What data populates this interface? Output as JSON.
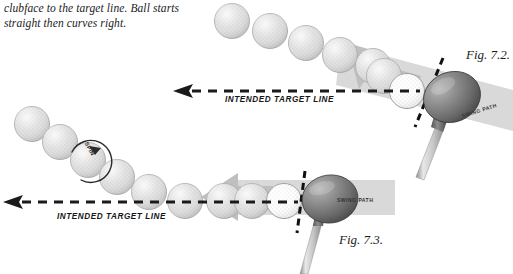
{
  "caption": {
    "text": "clubface to the target line. Ball starts straight then curves right."
  },
  "figures": [
    {
      "id": "fig-7-2",
      "label": "Fig. 7.2.",
      "target_line_label": "INTENDED TARGET LINE",
      "swing_path_label": "SWING PATH",
      "description": "Golf driver at impact with swing path angled out-to-in, ball trajectory curving left and upward",
      "ball_count": 7,
      "impact_ball_color": "#ffffff",
      "flight_ball_color": "#dadada",
      "swing_path_band_color": "#d8d8d8",
      "swing_path_arrow_color": "#bdbdbd",
      "club_head_color": "#6e6e6e",
      "club_shaft_color": "#c9c9c9",
      "target_line_color": "#1a1a1a",
      "clubface_line_color": "#111111"
    },
    {
      "id": "fig-7-3",
      "label": "Fig. 7.3.",
      "target_line_label": "INTENDED TARGET LINE",
      "swing_path_label": "SWING PATH",
      "spin_label": "SPIN",
      "description": "Golf driver at impact with level swing path, ball starts straight then curves with sidespin",
      "ball_count": 8,
      "impact_ball_color": "#ffffff",
      "flight_ball_color": "#dadada",
      "swing_path_band_color": "#d8d8d8",
      "swing_path_arrow_color": "#bdbdbd",
      "club_head_color": "#6e6e6e",
      "club_shaft_color": "#c9c9c9",
      "target_line_color": "#1a1a1a",
      "clubface_line_color": "#111111"
    }
  ],
  "colors": {
    "background": "#ffffff",
    "text": "#1b1b1b",
    "ball_fill": "#dcdcdc",
    "ball_stroke": "#a8a8a8",
    "band": "#d8d8d8",
    "arrow": "#bcbcbc",
    "clubhead_dark": "#4f4f4f",
    "clubhead_light": "#9a9a9a",
    "shaft": "#cfcfcf"
  }
}
